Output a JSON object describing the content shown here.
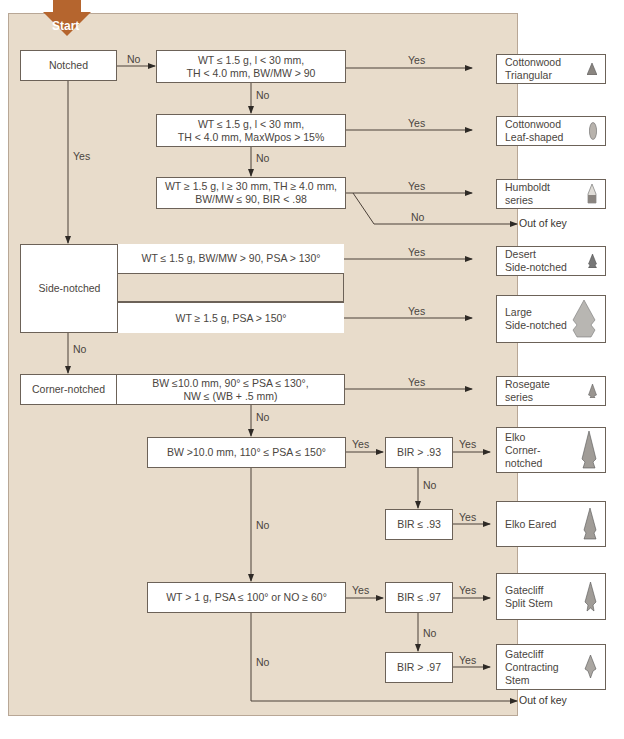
{
  "start": {
    "label": "Start",
    "color": "#b5652e"
  },
  "edge_labels": {
    "yes": "Yes",
    "no": "No"
  },
  "categories": {
    "notched": "Notched",
    "side_notched": "Side-notched",
    "corner_notched": "Corner-notched"
  },
  "conditions": {
    "c1": "WT ≤ 1.5 g, l < 30 mm,\nTH < 4.0 mm, BW/MW > 90",
    "c2": "WT ≤ 1.5 g, l < 30 mm,\nTH < 4.0 mm, MaxWpos > 15%",
    "c3": "WT ≥ 1.5 g, l ≥ 30 mm, TH ≥ 4.0 mm,\nBW/MW ≤ 90, BIR < .98",
    "s1": "WT ≤ 1.5 g, BW/MW > 90, PSA > 130°",
    "s2": "WT ≥ 1.5 g, PSA > 150°",
    "k1": "BW  ≤10.0 mm, 90° ≤ PSA ≤ 130°,\nNW ≤ (WB + .5 mm)",
    "k2": "BW  >10.0 mm, 110° ≤ PSA ≤ 150°",
    "k3": "WT > 1 g, PSA ≤ 100° or NO ≥ 60°",
    "b1": "BIR > .93",
    "b2": "BIR ≤ .93",
    "b3": "BIR ≤ .97",
    "b4": "BIR > .97"
  },
  "results": {
    "cottonwood_triangular": "Cottonwood\nTriangular",
    "cottonwood_leaf": "Cottonwood\nLeaf-shaped",
    "humboldt": "Humboldt\nseries",
    "desert_side": "Desert\nSide-notched",
    "large_side": "Large\nSide-notched",
    "rosegate": "Rosegate\nseries",
    "elko_corner": "Elko\nCorner-\nnotched",
    "elko_eared": "Elko Eared",
    "gatecliff_split": "Gatecliff\nSplit Stem",
    "gatecliff_contracting": "Gatecliff\nContracting\nStem"
  },
  "out_of_key": "Out of key"
}
